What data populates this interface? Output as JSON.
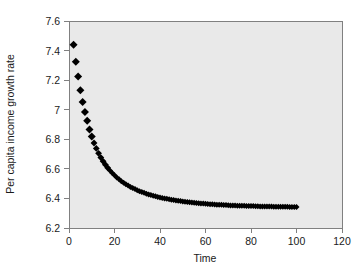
{
  "chart_data": {
    "type": "scatter",
    "title": "",
    "subtitle": "",
    "xlabel": "Time",
    "ylabel": "Per capita income growth rate",
    "xlim": [
      0,
      120
    ],
    "ylim": [
      6.2,
      7.6
    ],
    "xticks": [
      0,
      20,
      40,
      60,
      80,
      100,
      120
    ],
    "yticks": [
      6.2,
      6.4,
      6.6,
      6.8,
      7,
      7.2,
      7.4,
      7.6
    ],
    "xtick_labels": [
      "0",
      "20",
      "40",
      "60",
      "80",
      "100",
      "120"
    ],
    "ytick_labels": [
      "6.2",
      "6.4",
      "6.6",
      "6.8",
      "7",
      "7.2",
      "7.4",
      "7.6"
    ],
    "grid": false,
    "legend": false,
    "legend_position": "none",
    "marker": "diamond",
    "marker_color": "#000000",
    "plot_background": "#e9e9e9",
    "figure_background": "#ffffff",
    "axis_color": "#808080",
    "series": [
      {
        "name": "Per capita income growth rate",
        "x": [
          2,
          3,
          4,
          5,
          6,
          7,
          8,
          9,
          10,
          11,
          12,
          13,
          14,
          15,
          16,
          17,
          18,
          19,
          20,
          21,
          22,
          23,
          24,
          25,
          26,
          27,
          28,
          29,
          30,
          31,
          32,
          33,
          34,
          35,
          36,
          37,
          38,
          39,
          40,
          41,
          42,
          43,
          44,
          45,
          46,
          47,
          48,
          49,
          50,
          51,
          52,
          53,
          54,
          55,
          56,
          57,
          58,
          59,
          60,
          61,
          62,
          63,
          64,
          65,
          66,
          67,
          68,
          69,
          70,
          71,
          72,
          73,
          74,
          75,
          76,
          77,
          78,
          79,
          80,
          81,
          82,
          83,
          84,
          85,
          86,
          87,
          88,
          89,
          90,
          91,
          92,
          93,
          94,
          95,
          96,
          97,
          98,
          99,
          100
        ],
        "y": [
          7.44,
          7.325,
          7.225,
          7.132,
          7.052,
          6.985,
          6.925,
          6.866,
          6.818,
          6.775,
          6.738,
          6.705,
          6.676,
          6.651,
          6.628,
          6.607,
          6.589,
          6.572,
          6.556,
          6.542,
          6.529,
          6.517,
          6.506,
          6.496,
          6.487,
          6.478,
          6.47,
          6.463,
          6.456,
          6.449,
          6.443,
          6.438,
          6.432,
          6.427,
          6.423,
          6.418,
          6.414,
          6.41,
          6.407,
          6.403,
          6.4,
          6.397,
          6.394,
          6.391,
          6.389,
          6.386,
          6.384,
          6.382,
          6.38,
          6.378,
          6.376,
          6.374,
          6.372,
          6.371,
          6.369,
          6.368,
          6.366,
          6.365,
          6.364,
          6.363,
          6.361,
          6.36,
          6.359,
          6.358,
          6.357,
          6.357,
          6.356,
          6.355,
          6.354,
          6.353,
          6.353,
          6.352,
          6.351,
          6.351,
          6.35,
          6.35,
          6.349,
          6.349,
          6.348,
          6.348,
          6.347,
          6.347,
          6.346,
          6.346,
          6.346,
          6.345,
          6.345,
          6.345,
          6.344,
          6.344,
          6.344,
          6.343,
          6.343,
          6.343,
          6.343,
          6.342,
          6.342,
          6.342,
          6.342
        ]
      }
    ]
  }
}
